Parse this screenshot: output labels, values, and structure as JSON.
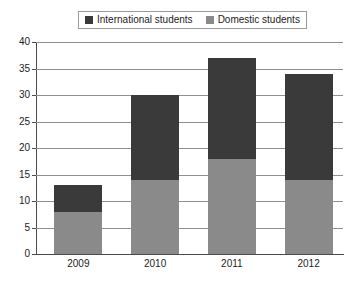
{
  "chart_data": {
    "type": "bar",
    "subtype": "stacked-bar",
    "title": "",
    "xlabel": "",
    "ylabel": "",
    "categories": [
      "2009",
      "2010",
      "2011",
      "2012"
    ],
    "series": [
      {
        "name": "Domestic students",
        "color": "#8a8a8a",
        "values": [
          8,
          14,
          18,
          14
        ]
      },
      {
        "name": "International students",
        "color": "#3a3a3a",
        "values": [
          5,
          16,
          19,
          20
        ]
      }
    ],
    "totals": [
      13,
      30,
      37,
      34
    ],
    "ylim": [
      0,
      40
    ],
    "ytick_values": [
      0,
      5,
      10,
      15,
      20,
      25,
      30,
      35,
      40
    ],
    "ytick_labels": [
      "0",
      "5",
      "10",
      "15",
      "20",
      "25",
      "30",
      "35",
      "40"
    ],
    "grid": true,
    "legend_position": "top-center",
    "legend_entries": [
      {
        "label": "International students",
        "color": "#3a3a3a"
      },
      {
        "label": "Domestic students",
        "color": "#8a8a8a"
      }
    ]
  },
  "colors": {
    "international": "#3a3a3a",
    "domestic": "#8a8a8a",
    "gridline": "#8f8f8f",
    "axis": "#4a4a4a",
    "legend_border": "#9a9a9a",
    "background": "#ffffff",
    "text": "#1d1d1d"
  }
}
